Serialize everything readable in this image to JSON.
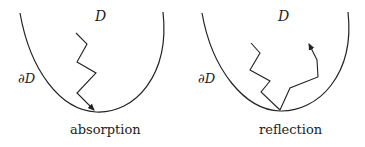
{
  "panels": [
    {
      "id": "absorption",
      "domain_label": "D",
      "boundary_label": "∂D",
      "caption": "absorption"
    },
    {
      "id": "reflection",
      "domain_label": "D",
      "boundary_label": "∂D",
      "caption": "reflection"
    }
  ],
  "colors": {
    "stroke": "#222222",
    "background": "#ffffff"
  }
}
